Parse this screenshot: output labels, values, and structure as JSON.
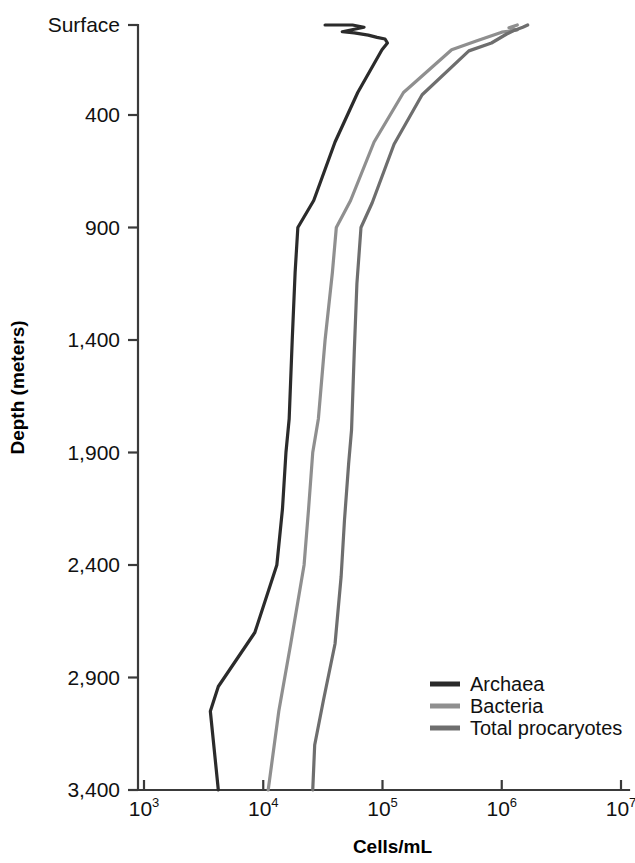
{
  "chart_data": {
    "type": "line",
    "orientation": "vertical-profile",
    "title": "",
    "xlabel": "Cells/mL",
    "ylabel": "Depth (meters)",
    "xscale": "log",
    "xlim": [
      1000,
      10000000
    ],
    "ylim": [
      0,
      3400
    ],
    "grid": false,
    "x_ticks": [
      {
        "value": 1000,
        "base": "10",
        "exponent": "3",
        "label": "10^3"
      },
      {
        "value": 10000,
        "base": "10",
        "exponent": "4",
        "label": "10^4"
      },
      {
        "value": 100000,
        "base": "10",
        "exponent": "5",
        "label": "10^5"
      },
      {
        "value": 1000000,
        "base": "10",
        "exponent": "6",
        "label": "10^6"
      },
      {
        "value": 10000000,
        "base": "10",
        "exponent": "7",
        "label": "10^7"
      }
    ],
    "y_ticks": [
      {
        "value": 0,
        "label": "Surface"
      },
      {
        "value": 400,
        "label": "400"
      },
      {
        "value": 900,
        "label": "900"
      },
      {
        "value": 1400,
        "label": "1,400"
      },
      {
        "value": 1900,
        "label": "1,900"
      },
      {
        "value": 2400,
        "label": "2,400"
      },
      {
        "value": 2900,
        "label": "2,900"
      },
      {
        "value": 3400,
        "label": "3,400"
      }
    ],
    "legend_position": "bottom-right",
    "series": [
      {
        "name": "Archaea",
        "color": "#2b2b2b",
        "width": 3.2,
        "points": [
          {
            "cells": 33000,
            "depth": 0
          },
          {
            "cells": 56000,
            "depth": 0
          },
          {
            "cells": 70000,
            "depth": 10
          },
          {
            "cells": 46000,
            "depth": 30
          },
          {
            "cells": 58000,
            "depth": 35
          },
          {
            "cells": 76000,
            "depth": 45
          },
          {
            "cells": 90000,
            "depth": 55
          },
          {
            "cells": 105000,
            "depth": 62
          },
          {
            "cells": 110000,
            "depth": 80
          },
          {
            "cells": 99000,
            "depth": 110
          },
          {
            "cells": 62000,
            "depth": 300
          },
          {
            "cells": 40000,
            "depth": 520
          },
          {
            "cells": 26500,
            "depth": 780
          },
          {
            "cells": 19500,
            "depth": 900
          },
          {
            "cells": 18500,
            "depth": 1100
          },
          {
            "cells": 17500,
            "depth": 1400
          },
          {
            "cells": 16500,
            "depth": 1750
          },
          {
            "cells": 15500,
            "depth": 1900
          },
          {
            "cells": 14500,
            "depth": 2150
          },
          {
            "cells": 13000,
            "depth": 2400
          },
          {
            "cells": 8500,
            "depth": 2700
          },
          {
            "cells": 4200,
            "depth": 2940
          },
          {
            "cells": 3600,
            "depth": 3050
          },
          {
            "cells": 4200,
            "depth": 3400
          }
        ]
      },
      {
        "name": "Bacteria",
        "color": "#8f8f8f",
        "width": 3.2,
        "points": [
          {
            "cells": 1350000,
            "depth": 0
          },
          {
            "cells": 1150000,
            "depth": 12
          },
          {
            "cells": 1350000,
            "depth": 22
          },
          {
            "cells": 1000000,
            "depth": 32
          },
          {
            "cells": 620000,
            "depth": 70
          },
          {
            "cells": 380000,
            "depth": 110
          },
          {
            "cells": 150000,
            "depth": 300
          },
          {
            "cells": 85000,
            "depth": 520
          },
          {
            "cells": 54000,
            "depth": 780
          },
          {
            "cells": 41000,
            "depth": 900
          },
          {
            "cells": 38000,
            "depth": 1100
          },
          {
            "cells": 33000,
            "depth": 1400
          },
          {
            "cells": 29000,
            "depth": 1750
          },
          {
            "cells": 26000,
            "depth": 1900
          },
          {
            "cells": 24000,
            "depth": 2150
          },
          {
            "cells": 22000,
            "depth": 2400
          },
          {
            "cells": 17000,
            "depth": 2750
          },
          {
            "cells": 13500,
            "depth": 3050
          },
          {
            "cells": 11000,
            "depth": 3400
          }
        ]
      },
      {
        "name": "Total procaryotes",
        "color": "#6e6e6e",
        "width": 3.2,
        "points": [
          {
            "cells": 1650000,
            "depth": 0
          },
          {
            "cells": 1500000,
            "depth": 10
          },
          {
            "cells": 1250000,
            "depth": 26
          },
          {
            "cells": 1100000,
            "depth": 40
          },
          {
            "cells": 820000,
            "depth": 80
          },
          {
            "cells": 530000,
            "depth": 115
          },
          {
            "cells": 215000,
            "depth": 310
          },
          {
            "cells": 125000,
            "depth": 530
          },
          {
            "cells": 82000,
            "depth": 790
          },
          {
            "cells": 66000,
            "depth": 900
          },
          {
            "cells": 61000,
            "depth": 1150
          },
          {
            "cells": 58000,
            "depth": 1450
          },
          {
            "cells": 55000,
            "depth": 1800
          },
          {
            "cells": 52000,
            "depth": 1950
          },
          {
            "cells": 48000,
            "depth": 2200
          },
          {
            "cells": 45000,
            "depth": 2450
          },
          {
            "cells": 40000,
            "depth": 2750
          },
          {
            "cells": 32000,
            "depth": 3000
          },
          {
            "cells": 27000,
            "depth": 3200
          },
          {
            "cells": 26000,
            "depth": 3400
          }
        ]
      }
    ]
  }
}
